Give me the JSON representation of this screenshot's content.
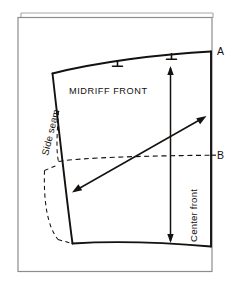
{
  "diagram": {
    "type": "sewing-pattern-draft",
    "width": 235,
    "height": 281,
    "background_color": "#ffffff",
    "line_color": "#14110f",
    "sheet_edge_color": "#9a9a9a",
    "labels": {
      "piece_name": "MIDRIFF FRONT",
      "side_seam": "Side seam",
      "center_front": "Center front",
      "mark_a": "A",
      "mark_b": "B"
    },
    "annotations": {
      "notch_count": 2,
      "notch_label": "notch",
      "grainline_label": "grainline-arrow",
      "bust_level_label": "B",
      "waist_level_label": "A"
    },
    "guides": {
      "dashed_level_line": "B",
      "dashed_dart_legs": 2
    }
  }
}
